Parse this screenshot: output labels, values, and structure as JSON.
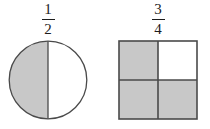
{
  "background_color": "#ffffff",
  "stroke_color": "#4a4a4a",
  "shade_color": "#c8c8c8",
  "unshaded_color": "#ffffff",
  "text_color": "#1c1c1c",
  "figures": [
    {
      "id": "circle",
      "shape_name": "circle",
      "label": {
        "numerator": "1",
        "denominator": "2",
        "text": "1/2"
      },
      "parts_total": 2,
      "parts_shaded": 1,
      "divider_orientation": "vertical",
      "regions": [
        {
          "name": "left-half",
          "shaded": true
        },
        {
          "name": "right-half",
          "shaded": false
        }
      ]
    },
    {
      "id": "square",
      "shape_name": "square",
      "label": {
        "numerator": "3",
        "denominator": "4",
        "text": "3/4"
      },
      "parts_total": 4,
      "parts_shaded": 3,
      "divider_orientation": "vertical-and-horizontal",
      "regions": [
        {
          "name": "top-left-quadrant",
          "shaded": true
        },
        {
          "name": "top-right-quadrant",
          "shaded": false
        },
        {
          "name": "bottom-left-quadrant",
          "shaded": true
        },
        {
          "name": "bottom-right-quadrant",
          "shaded": true
        }
      ]
    }
  ]
}
